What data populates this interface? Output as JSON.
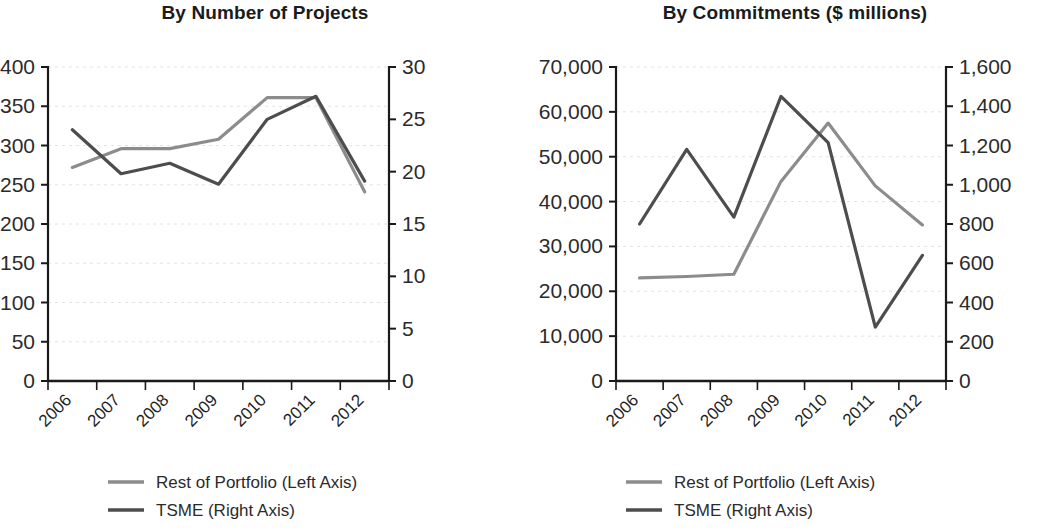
{
  "charts": [
    {
      "title": "By Number of Projects",
      "legend": [
        {
          "label": "Rest of Portfolio (Left Axis)",
          "color": "#8c8c8c"
        },
        {
          "label": "TSME (Right Axis)",
          "color": "#4d4d4d"
        }
      ]
    },
    {
      "title": "By Commitments ($ millions)",
      "legend": [
        {
          "label": "Rest of Portfolio (Left Axis)",
          "color": "#8c8c8c"
        },
        {
          "label": "TSME (Right Axis)",
          "color": "#4d4d4d"
        }
      ]
    }
  ],
  "colors": {
    "rest_of_portfolio": "#8c8c8c",
    "tsme": "#4d4d4d",
    "axis": "#1a1a1a",
    "gridline": "#e2e2e2",
    "text": "#1f1f1f",
    "background": "#ffffff"
  },
  "chart_data": [
    {
      "type": "line",
      "title": "By Number of Projects",
      "xlabel": "",
      "ylabel": "",
      "grid": true,
      "legend_position": "bottom-left",
      "categories": [
        "2006",
        "2007",
        "2008",
        "2009",
        "2010",
        "2011",
        "2012"
      ],
      "x_tick_labels": [
        "2006",
        "2007",
        "2008",
        "2009",
        "2010",
        "2011",
        "2012"
      ],
      "left_axis": {
        "label": "",
        "ylim": [
          0,
          400
        ],
        "ticks": [
          0,
          50,
          100,
          150,
          200,
          250,
          300,
          350,
          400
        ],
        "tick_labels": [
          "0",
          "50",
          "100",
          "150",
          "200",
          "250",
          "300",
          "350",
          "400"
        ]
      },
      "right_axis": {
        "label": "",
        "ylim": [
          0,
          30
        ],
        "ticks": [
          0,
          5,
          10,
          15,
          20,
          25,
          30
        ],
        "tick_labels": [
          "0",
          "5",
          "10",
          "15",
          "20",
          "25",
          "30"
        ]
      },
      "series": [
        {
          "name": "Rest of Portfolio (Left Axis)",
          "axis": "left",
          "color": "#8c8c8c",
          "values": [
            272,
            296,
            296,
            308,
            361,
            361,
            241
          ]
        },
        {
          "name": "TSME (Right Axis)",
          "axis": "right",
          "color": "#4d4d4d",
          "values": [
            24.0,
            19.8,
            20.8,
            18.8,
            25.0,
            27.2,
            19.1
          ]
        }
      ]
    },
    {
      "type": "line",
      "title": "By Commitments ($ millions)",
      "xlabel": "",
      "ylabel": "",
      "grid": true,
      "legend_position": "bottom-left",
      "categories": [
        "2006",
        "2007",
        "2008",
        "2009",
        "2010",
        "2011",
        "2012"
      ],
      "x_tick_labels": [
        "2006",
        "2007",
        "2008",
        "2009",
        "2010",
        "2011",
        "2012"
      ],
      "left_axis": {
        "label": "",
        "ylim": [
          0,
          70000
        ],
        "ticks": [
          0,
          10000,
          20000,
          30000,
          40000,
          50000,
          60000,
          70000
        ],
        "tick_labels": [
          "0",
          "10,000",
          "20,000",
          "30,000",
          "40,000",
          "50,000",
          "60,000",
          "70,000"
        ]
      },
      "right_axis": {
        "label": "",
        "ylim": [
          0,
          1600
        ],
        "ticks": [
          0,
          200,
          400,
          600,
          800,
          1000,
          1200,
          1400,
          1600
        ],
        "tick_labels": [
          "0",
          "200",
          "400",
          "600",
          "800",
          "1,000",
          "1,200",
          "1,400",
          "1,600"
        ]
      },
      "series": [
        {
          "name": "Rest of Portfolio (Left Axis)",
          "axis": "left",
          "color": "#8c8c8c",
          "values": [
            23000,
            23300,
            23800,
            44500,
            57500,
            43500,
            34800
          ]
        },
        {
          "name": "TSME (Right Axis)",
          "axis": "right",
          "color": "#4d4d4d",
          "values": [
            800,
            1180,
            835,
            1450,
            1215,
            275,
            640
          ]
        }
      ]
    }
  ]
}
